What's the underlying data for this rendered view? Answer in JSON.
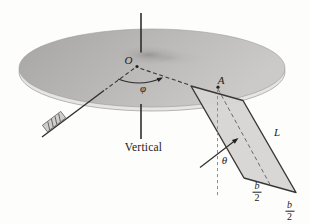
{
  "figure": {
    "labels": {
      "origin": "O",
      "azimuth_angle": "φ",
      "point_a": "A",
      "tilt_angle": "θ",
      "plate_length": "L",
      "vertical_axis": "Vertical",
      "half_width_numerator": "b",
      "half_width_denominator": "2"
    },
    "colors": {
      "background": "#fdfdfc",
      "disk_top_dark": "#a6a5a3",
      "disk_top_light": "#cbcac8",
      "disk_rim": "#e6e5e3",
      "disk_dimple": "#8c8b89",
      "plate_fill": "#d6d5d3",
      "line_color": "#2f2e2c"
    }
  }
}
